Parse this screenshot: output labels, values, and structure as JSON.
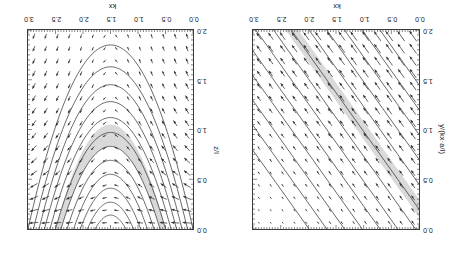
{
  "figure": {
    "orientation_degrees": 180,
    "panel_count": 2,
    "background_color": "#ffffff",
    "shade_color": "#d9d9d9",
    "line_color": "#2b2b2b"
  },
  "chart_data": [
    {
      "id": "left-panel",
      "type": "line",
      "title": "",
      "xlabel": "kx",
      "ylabel": "y/(kx·a/l)",
      "xlim": [
        0.0,
        3.0
      ],
      "ylim": [
        0.0,
        2.0
      ],
      "y_axis_inverted": true,
      "grid": false,
      "legend": "none",
      "xticks": [
        0.0,
        0.5,
        1.0,
        1.5,
        2.0,
        2.5,
        3.0
      ],
      "xticklabels": [
        "0.0",
        "0.5",
        "1.0",
        "1.5",
        "2.0",
        "2.5",
        "3.0"
      ],
      "yticks": [
        0.0,
        0.5,
        1.0,
        1.5,
        2.0
      ],
      "yticklabels": [
        "0.0",
        "0.5",
        "1.0",
        "1.5",
        "2.0"
      ],
      "contour_description": "family of parallel straight diagonal contour lines of constant slope rising from lower-left to upper-right",
      "contour_slope": 0.78,
      "contour_count": 13,
      "contour_intercepts": [
        -1.55,
        -1.3,
        -1.05,
        -0.8,
        -0.55,
        -0.3,
        -0.05,
        0.2,
        0.45,
        0.7,
        0.95,
        1.2,
        1.45
      ],
      "shaded_band": {
        "description": "grey diagonal band parallel to the contours",
        "slope": 0.78,
        "intercept_low": 0.12,
        "intercept_high": 0.3,
        "color": "#d9d9d9"
      },
      "vector_field": {
        "description": "arrows aligned with the diagonal contours, magnitude growing toward lower-left",
        "columns": 14,
        "rows": 16,
        "direction_degrees": 38
      }
    },
    {
      "id": "right-panel",
      "type": "line",
      "title": "",
      "xlabel": "kx",
      "ylabel": "z/l",
      "xlim": [
        0.0,
        3.0
      ],
      "ylim": [
        0.0,
        2.0
      ],
      "y_axis_inverted": true,
      "grid": false,
      "legend": "none",
      "xticks": [
        0.0,
        0.5,
        1.0,
        1.5,
        2.0,
        2.5,
        3.0
      ],
      "xticklabels": [
        "0.0",
        "0.5",
        "1.0",
        "1.5",
        "2.0",
        "2.5",
        "3.0"
      ],
      "yticks": [
        0.0,
        0.5,
        1.0,
        1.5,
        2.0
      ],
      "yticklabels": [
        "0.0",
        "0.5",
        "1.0",
        "1.5",
        "2.0"
      ],
      "contour_description": "nested U-shaped (parabolic) closed contours symmetric about kx = 1.5, nested about a common vertical axis and opening upward toward z/l = 0",
      "contour_count": 12,
      "contour_axis_x": 1.5,
      "contour_vertex_depths": [
        0.14,
        0.27,
        0.41,
        0.55,
        0.69,
        0.83,
        0.97,
        1.12,
        1.28,
        1.45,
        1.63,
        1.85
      ],
      "contour_half_widths": [
        0.28,
        0.42,
        0.55,
        0.67,
        0.79,
        0.9,
        1.0,
        1.1,
        1.2,
        1.3,
        1.4,
        1.5
      ],
      "shaded_band": {
        "description": "grey U-shaped band between two adjacent parabolic contours near z/l = 0.85-1.15",
        "vertex_depth_inner": 0.83,
        "vertex_depth_outer": 1.05,
        "color": "#d9d9d9"
      },
      "vector_field": {
        "description": "arrows tangent to the parabolic contours; nearly vertical near the left and right edges and nearly horizontal near the vertex region",
        "columns": 14,
        "rows": 16
      }
    }
  ],
  "panels": [
    {
      "name": "left",
      "x_axis_title": "kx",
      "y_axis_title": "y/(kx·a/l)",
      "x_tick_labels": [
        "0.0",
        "0.5",
        "1.0",
        "1.5",
        "2.0",
        "2.5",
        "3.0"
      ],
      "y_tick_labels": [
        "0.0",
        "0.5",
        "1.0",
        "1.5",
        "2.0"
      ]
    },
    {
      "name": "right",
      "x_axis_title": "kx",
      "y_axis_title": "z/l",
      "x_tick_labels": [
        "0.0",
        "0.5",
        "1.0",
        "1.5",
        "2.0",
        "2.5",
        "3.0"
      ],
      "y_tick_labels": [
        "0.0",
        "0.5",
        "1.0",
        "1.5",
        "2.0"
      ]
    }
  ]
}
